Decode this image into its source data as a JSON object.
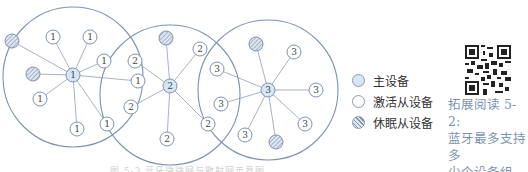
{
  "diagram": {
    "piconets": [
      {
        "id": 1,
        "circle": {
          "cx": 73,
          "cy": 77,
          "r": 70
        },
        "master": {
          "x": 73,
          "y": 75,
          "label": "1"
        },
        "slaves": [
          {
            "x": 53,
            "y": 37,
            "label": "1",
            "state": "active"
          },
          {
            "x": 90,
            "y": 37,
            "label": "1",
            "state": "active"
          },
          {
            "x": 104,
            "y": 61,
            "label": "1",
            "state": "active"
          },
          {
            "x": 138,
            "y": 81,
            "label": "1",
            "state": "active"
          },
          {
            "x": 40,
            "y": 99,
            "label": "1",
            "state": "active"
          },
          {
            "x": 77,
            "y": 129,
            "label": "1",
            "state": "active"
          },
          {
            "x": 107,
            "y": 124,
            "label": "1",
            "state": "active"
          },
          {
            "x": 12,
            "y": 41,
            "label": "",
            "state": "sleep"
          },
          {
            "x": 33,
            "y": 74,
            "label": "",
            "state": "sleep"
          }
        ]
      },
      {
        "id": 2,
        "circle": {
          "cx": 170,
          "cy": 95,
          "r": 70
        },
        "master": {
          "x": 170,
          "y": 86,
          "label": "2"
        },
        "slaves": [
          {
            "x": 135,
            "y": 61,
            "label": "2",
            "state": "active"
          },
          {
            "x": 131,
            "y": 107,
            "label": "2",
            "state": "active"
          },
          {
            "x": 200,
            "y": 49,
            "label": "2",
            "state": "active"
          },
          {
            "x": 208,
            "y": 124,
            "label": "2",
            "state": "active"
          },
          {
            "x": 167,
            "y": 139,
            "label": "2",
            "state": "active"
          },
          {
            "x": 166,
            "y": 38,
            "label": "",
            "state": "sleep"
          }
        ]
      },
      {
        "id": 3,
        "circle": {
          "cx": 268,
          "cy": 90,
          "r": 70
        },
        "master": {
          "x": 268,
          "y": 90,
          "label": "3"
        },
        "slaves": [
          {
            "x": 217,
            "y": 69,
            "label": "3",
            "state": "active"
          },
          {
            "x": 221,
            "y": 104,
            "label": "3",
            "state": "active"
          },
          {
            "x": 294,
            "y": 52,
            "label": "3",
            "state": "active"
          },
          {
            "x": 316,
            "y": 90,
            "label": "3",
            "state": "active"
          },
          {
            "x": 305,
            "y": 124,
            "label": "3",
            "state": "active"
          },
          {
            "x": 245,
            "y": 135,
            "label": "3",
            "state": "active"
          },
          {
            "x": 256,
            "y": 44,
            "label": "",
            "state": "sleep"
          },
          {
            "x": 276,
            "y": 142,
            "label": "",
            "state": "sleep"
          }
        ]
      }
    ]
  },
  "legend": {
    "items": [
      {
        "label": "主设备",
        "type": "master"
      },
      {
        "label": "激活从设备",
        "type": "active"
      },
      {
        "label": "休眠从设备",
        "type": "sleep"
      }
    ]
  },
  "extended_reading": {
    "line1": "拓展阅读 5-2:",
    "line2": "蓝牙最多支持多",
    "line3": "少个设备组网?"
  },
  "caption": "图 5-3 蓝牙微微网与散射网示意图",
  "colors": {
    "circle_stroke": "#7f93ad",
    "edge_stroke": "#8fa0b6",
    "master_fill": "#d6e6f5",
    "active_fill": "#ffffff",
    "sleep_fill": "#c9d3e3",
    "text_blue": "#7a93b4"
  }
}
